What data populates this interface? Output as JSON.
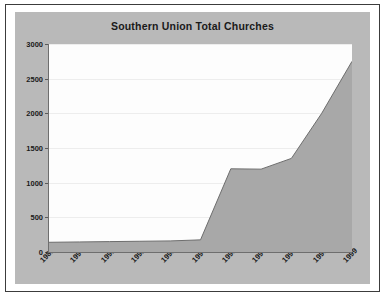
{
  "chart_data": {
    "type": "area",
    "title": "Southern Union Total Churches",
    "xlabel": "",
    "ylabel": "",
    "categories": [
      "1989",
      "1990",
      "1991",
      "1992",
      "1993",
      "1994",
      "1995",
      "1996",
      "1997",
      "1998",
      "1999"
    ],
    "values": [
      140,
      145,
      150,
      155,
      160,
      175,
      1200,
      1195,
      1350,
      2000,
      2750
    ],
    "series": [
      {
        "name": "Total Churches",
        "values": [
          140,
          145,
          150,
          155,
          160,
          175,
          1200,
          1195,
          1350,
          2000,
          2750
        ]
      }
    ],
    "ylim": [
      0,
      3000
    ],
    "yticks": [
      "0",
      "500",
      "1000",
      "1500",
      "2000",
      "2500",
      "3000"
    ],
    "ytick_values": [
      0,
      500,
      1000,
      1500,
      2000,
      2500,
      3000
    ],
    "grid": true,
    "legend": "none",
    "colors": {
      "area_fill": "#a8a8a8",
      "area_line": "#6e6e6e",
      "plot_background": "#fdfdfd",
      "chart_background": "#b9b9b9",
      "page_background": "#ffffff",
      "text": "#1a1a1a",
      "gridline": "#ededed",
      "border": "#3c3c3c"
    }
  }
}
